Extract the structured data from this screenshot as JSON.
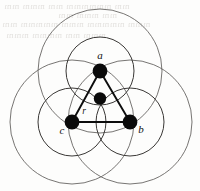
{
  "figure": {
    "caption": "",
    "background_color": "#fdfdfc",
    "stroke_color": "#5e5c5a",
    "accent_color": "#0a0a0a"
  },
  "labels": {
    "vertex_a": "a",
    "vertex_b": "b",
    "vertex_c": "c",
    "radius": "r"
  },
  "geometry": {
    "vertices": [
      {
        "id": "a",
        "label": "a",
        "x": 100,
        "y": 71,
        "dot_radius": 7.4,
        "label_x": 100,
        "label_y": 59
      },
      {
        "id": "b",
        "label": "b",
        "x": 130,
        "y": 122,
        "dot_radius": 7.4,
        "label_x": 141,
        "label_y": 133
      },
      {
        "id": "c",
        "label": "c",
        "x": 72,
        "y": 122,
        "dot_radius": 7.4,
        "label_x": 62,
        "label_y": 134
      }
    ],
    "center": {
      "id": "center",
      "x": 100,
      "y": 98.5,
      "dot_radius": 6.2
    },
    "radius_label": {
      "text": "r",
      "x": 84,
      "y": 114
    },
    "big_circles": [
      {
        "center_id": "a",
        "cx": 100,
        "cy": 71,
        "r": 62
      },
      {
        "center_id": "b",
        "cx": 130,
        "cy": 122,
        "r": 62
      },
      {
        "center_id": "c",
        "cx": 72,
        "cy": 122,
        "r": 62
      }
    ],
    "inner_circles": [
      {
        "center_id": "a",
        "cx": 100,
        "cy": 71,
        "r": 34
      },
      {
        "center_id": "b",
        "cx": 130,
        "cy": 122,
        "r": 34
      },
      {
        "center_id": "c",
        "cx": 72,
        "cy": 122,
        "r": 34
      }
    ],
    "triangle_edges": [
      {
        "from": "a",
        "to": "b"
      },
      {
        "from": "b",
        "to": "c"
      },
      {
        "from": "c",
        "to": "a"
      }
    ]
  },
  "ghost_text": {
    "note": "faint illegible show-through from reverse of scanned page",
    "lines": [
      {
        "text": "mm  mmmmmm  mm  mmm  mm",
        "x": 4,
        "y": 1,
        "size": 9
      },
      {
        "text": "mm   mmm   mm",
        "x": 58,
        "y": 10,
        "size": 9
      },
      {
        "text": "mmm  mmmmm  mmm  mmmmm  mm",
        "x": 2,
        "y": 19,
        "size": 9
      },
      {
        "text": "mmm  mm  mmmm  mmm",
        "x": 6,
        "y": 30,
        "size": 9
      }
    ]
  }
}
